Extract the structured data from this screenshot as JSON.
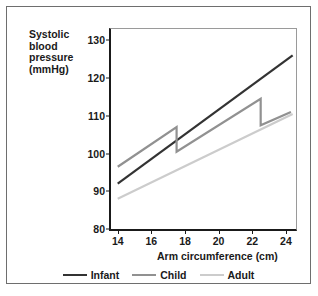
{
  "figure": {
    "border_color": "#6e6e6e"
  },
  "chart_data": {
    "type": "line",
    "title": "",
    "xlabel": "Arm circumference (cm)",
    "ylabel": "Systolic blood pressure (mmHg)",
    "ylabel_lines": [
      "Systolic",
      "blood",
      "pressure",
      "(mmHg)"
    ],
    "xlim": [
      13.6,
      24.6
    ],
    "ylim": [
      80,
      133
    ],
    "xticks": [
      14,
      16,
      18,
      20,
      22,
      24
    ],
    "yticks": [
      80,
      90,
      100,
      110,
      120,
      130
    ],
    "grid": false,
    "legend_position": "bottom",
    "series": [
      {
        "name": "Infant",
        "color": "#333333",
        "points": [
          [
            14,
            92.0
          ],
          [
            24.4,
            126.0
          ]
        ]
      },
      {
        "name": "Child",
        "color": "#919191",
        "points": [
          [
            14,
            96.5
          ],
          [
            17.5,
            107.0
          ],
          [
            17.5,
            100.5
          ],
          [
            22.5,
            114.5
          ],
          [
            22.5,
            107.5
          ],
          [
            24.3,
            111.0
          ]
        ]
      },
      {
        "name": "Adult",
        "color": "#cccccc",
        "points": [
          [
            14,
            88.0
          ],
          [
            24.4,
            110.5
          ]
        ]
      }
    ]
  },
  "legend": {
    "items": [
      {
        "label": "Infant",
        "color": "#333333"
      },
      {
        "label": "Child",
        "color": "#919191"
      },
      {
        "label": "Adult",
        "color": "#cccccc"
      }
    ]
  }
}
